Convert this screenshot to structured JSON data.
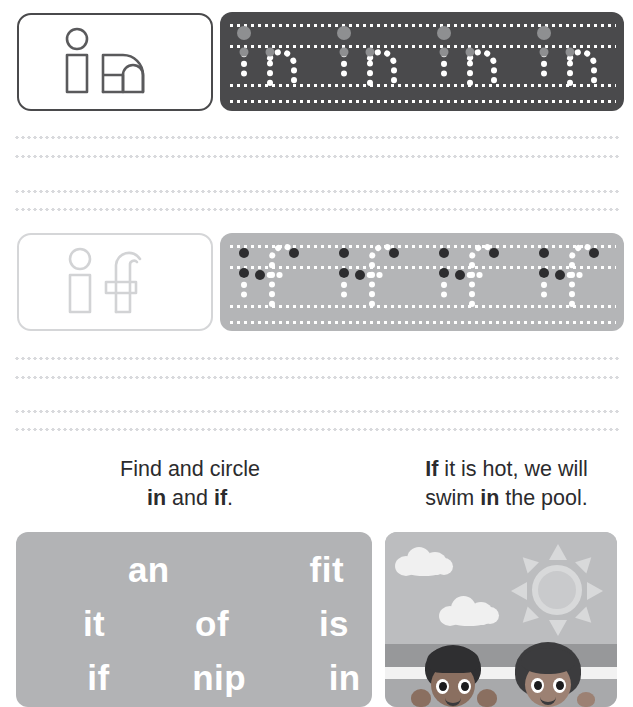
{
  "worksheet": {
    "rows": [
      {
        "id": "row-in",
        "word": "in",
        "theme": "dark",
        "model_label": "in",
        "trace_repeats": [
          "in",
          "in",
          "in",
          "in"
        ],
        "repeat_count": 4
      },
      {
        "id": "row-if",
        "word": "if",
        "theme": "light",
        "model_label": "if",
        "trace_repeats": [
          "if",
          "if",
          "if",
          "if"
        ],
        "repeat_count": 4
      }
    ],
    "practice_line_groups": [
      {
        "lines": [
          136,
          155,
          190,
          208
        ]
      },
      {
        "lines": [
          357,
          376,
          410,
          428
        ]
      }
    ],
    "instructions": {
      "left": {
        "line1": "Find and circle",
        "line2_prefix": "",
        "word1": "in",
        "between": " and ",
        "word2": "if",
        "suffix": "."
      },
      "right": {
        "line1_bold": "If",
        "line1_rest": " it is hot, we will",
        "line2_prefix": "swim ",
        "line2_bold": "in",
        "line2_rest": " the pool."
      }
    },
    "word_search": {
      "rows": [
        [
          "an",
          "fit"
        ],
        [
          "it",
          "of",
          "is"
        ],
        [
          "if",
          "nip",
          "in"
        ]
      ]
    },
    "illustration": {
      "alt": "two children in a swimming pool under a sunny sky",
      "elements": [
        "cloud",
        "cloud",
        "sun",
        "child-left",
        "child-right",
        "water"
      ]
    },
    "colors": {
      "dark_panel": "#4a4a4c",
      "light_panel": "#b4b5b7",
      "dark_border": "#4a4a4c",
      "light_border": "#d5d6d8",
      "dotted_line": "#d9dadd",
      "text": "#2b2b2d",
      "wordsearch_bg": "#b2b3b5",
      "wordsearch_text": "#ffffff",
      "sky": "#bcbdbf",
      "water": "#a8a9ab"
    }
  }
}
